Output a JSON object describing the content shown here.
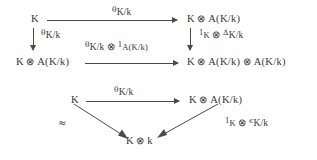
{
  "figure": {
    "kind": "commutative-diagram",
    "background_color": "#ffffff",
    "ink_color": "#383838",
    "arrow_color": "#4a4a4a"
  },
  "square": {
    "nodes": {
      "top_left": {
        "base": "K"
      },
      "top_right": {
        "left": "K",
        "tensor": "⊗",
        "right": "A(K/k)"
      },
      "bottom_left": {
        "left": "K",
        "tensor": "⊗",
        "right": "A(K/k)"
      },
      "bottom_right": {
        "a": "K",
        "t1": "⊗",
        "b": "A(K/k)",
        "t2": "⊗",
        "c": "A(K/k)"
      }
    },
    "arrows": {
      "top": {
        "symbol": "θ",
        "subscript": "K/k"
      },
      "left": {
        "symbol": "θ",
        "subscript": "K/k"
      },
      "right": {
        "one": "1",
        "one_sub": "K",
        "tensor": "⊗",
        "symbol": "Δ",
        "subscript": "K/k"
      },
      "bottom": {
        "symbol": "θ",
        "subscript": "K/k",
        "tensor": "⊗",
        "one": "1",
        "one_sub": "A(K/k)"
      }
    }
  },
  "triangle": {
    "nodes": {
      "top_left": {
        "base": "K"
      },
      "top_right": {
        "left": "K",
        "tensor": "⊗",
        "right": "A(K/k)"
      },
      "bottom": {
        "left": "K",
        "tensor": "⊗",
        "right": "k"
      }
    },
    "arrows": {
      "top": {
        "symbol": "θ",
        "subscript": "K/k"
      },
      "left_diagonal": {
        "symbol": "≈"
      },
      "right_diagonal": {
        "one": "1",
        "one_sub": "K",
        "tensor": "⊗",
        "symbol": "ϵ",
        "subscript": "K/k"
      }
    }
  }
}
